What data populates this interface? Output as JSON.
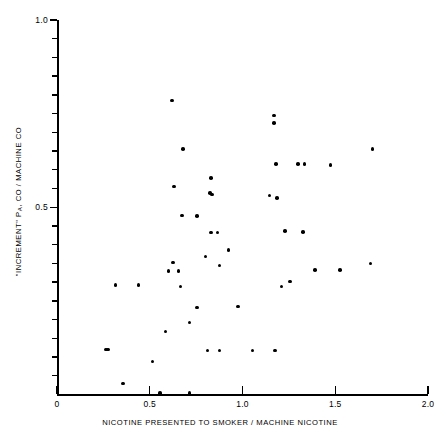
{
  "chart_data": {
    "type": "scatter",
    "title": "",
    "xlabel": "NICOTINE PRESENTED TO SMOKER / MACHINE NICOTINE",
    "ylabel": "\"INCREMENT\" PA, CO / MACHINE CO",
    "ylabel_prefix": "\"INCREMENT\" P",
    "ylabel_sub": "A",
    "ylabel_suffix": ", CO / MACHINE CO",
    "xlim": [
      0,
      2.0
    ],
    "ylim": [
      0,
      1.0
    ],
    "xticks": [
      0,
      0.5,
      1.0,
      1.5,
      2.0
    ],
    "xticklabels": [
      "0",
      "0.5",
      "1.0",
      "1.5",
      "2.0"
    ],
    "yticks": [
      0.5,
      1.0
    ],
    "yticklabels": [
      "0.5",
      "1.0"
    ],
    "y_minor_tick_step": 0.05,
    "grid": false,
    "legend": null,
    "marker": "filled-circle",
    "marker_color": "#000000",
    "points": [
      {
        "x": 0.62,
        "y": 0.785
      },
      {
        "x": 1.17,
        "y": 0.745
      },
      {
        "x": 1.17,
        "y": 0.725
      },
      {
        "x": 0.68,
        "y": 0.655
      },
      {
        "x": 1.7,
        "y": 0.655
      },
      {
        "x": 1.18,
        "y": 0.615
      },
      {
        "x": 1.3,
        "y": 0.615
      },
      {
        "x": 1.335,
        "y": 0.615
      },
      {
        "x": 1.475,
        "y": 0.613
      },
      {
        "x": 0.83,
        "y": 0.578
      },
      {
        "x": 0.63,
        "y": 0.556
      },
      {
        "x": 0.825,
        "y": 0.538
      },
      {
        "x": 0.835,
        "y": 0.534
      },
      {
        "x": 1.145,
        "y": 0.532
      },
      {
        "x": 1.185,
        "y": 0.525
      },
      {
        "x": 0.675,
        "y": 0.478
      },
      {
        "x": 0.755,
        "y": 0.476
      },
      {
        "x": 0.83,
        "y": 0.432
      },
      {
        "x": 0.865,
        "y": 0.432
      },
      {
        "x": 1.23,
        "y": 0.437
      },
      {
        "x": 1.325,
        "y": 0.434
      },
      {
        "x": 0.925,
        "y": 0.386
      },
      {
        "x": 0.8,
        "y": 0.368
      },
      {
        "x": 0.875,
        "y": 0.344
      },
      {
        "x": 0.6,
        "y": 0.33
      },
      {
        "x": 0.625,
        "y": 0.352
      },
      {
        "x": 0.655,
        "y": 0.33
      },
      {
        "x": 1.69,
        "y": 0.35
      },
      {
        "x": 1.39,
        "y": 0.333
      },
      {
        "x": 1.525,
        "y": 0.332
      },
      {
        "x": 0.315,
        "y": 0.292
      },
      {
        "x": 0.44,
        "y": 0.292
      },
      {
        "x": 0.665,
        "y": 0.288
      },
      {
        "x": 1.21,
        "y": 0.288
      },
      {
        "x": 1.255,
        "y": 0.302
      },
      {
        "x": 0.755,
        "y": 0.232
      },
      {
        "x": 0.975,
        "y": 0.235
      },
      {
        "x": 0.715,
        "y": 0.192
      },
      {
        "x": 0.585,
        "y": 0.168
      },
      {
        "x": 0.265,
        "y": 0.12
      },
      {
        "x": 0.275,
        "y": 0.12
      },
      {
        "x": 0.81,
        "y": 0.118
      },
      {
        "x": 0.875,
        "y": 0.118
      },
      {
        "x": 1.055,
        "y": 0.118
      },
      {
        "x": 1.175,
        "y": 0.118
      },
      {
        "x": 0.515,
        "y": 0.088
      },
      {
        "x": 0.355,
        "y": 0.03
      },
      {
        "x": 0.555,
        "y": 0.004
      },
      {
        "x": 0.715,
        "y": 0.004
      }
    ]
  }
}
